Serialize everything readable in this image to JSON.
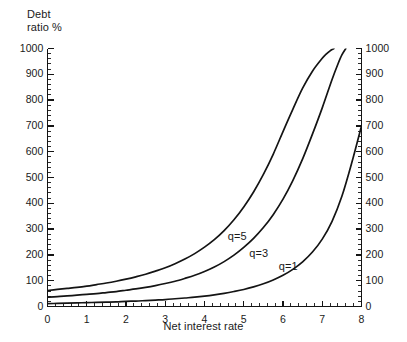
{
  "chart_data": {
    "type": "line",
    "title": "",
    "subtitle": "",
    "xlabel": "Net interest rate",
    "ylabel": "Debt ratio %",
    "ylabel_line1": "Debt",
    "ylabel_line2": "ratio %",
    "xlim": [
      0,
      8
    ],
    "ylim": [
      0,
      1000
    ],
    "grid": false,
    "legend_position": "inline-curve-labels",
    "dual_y_axis": true,
    "x_ticks": [
      0,
      1,
      2,
      3,
      4,
      5,
      6,
      7,
      8
    ],
    "x_tick_labels": [
      "0",
      "1",
      "2",
      "3",
      "4",
      "5",
      "6",
      "7",
      "8"
    ],
    "x_minor_tick_step": 0.2,
    "y_ticks": [
      0,
      100,
      200,
      300,
      400,
      500,
      600,
      700,
      800,
      900,
      1000
    ],
    "y_tick_labels": [
      "0",
      "100",
      "200",
      "300",
      "400",
      "500",
      "600",
      "700",
      "800",
      "900",
      "1000"
    ],
    "y_minor_tick_step": 20,
    "y_ticks_right": [
      0,
      100,
      200,
      300,
      400,
      500,
      600,
      700,
      800,
      900,
      1000
    ],
    "y_tick_labels_right": [
      "0",
      "100",
      "200",
      "300",
      "400",
      "500",
      "600",
      "700",
      "800",
      "900",
      "1000"
    ],
    "line_color": "#141414",
    "axis_color": "#141414",
    "background_color": "#ffffff",
    "series": [
      {
        "name": "q = 5",
        "label": "q=5",
        "label_x": 5.0,
        "label_y": 268,
        "x": [
          0.0,
          0.25,
          0.5,
          0.75,
          1.0,
          1.25,
          1.5,
          1.75,
          2.0,
          2.25,
          2.5,
          2.75,
          3.0,
          3.25,
          3.5,
          3.75,
          4.0,
          4.25,
          4.5,
          4.75,
          5.0,
          5.25,
          5.5,
          5.75,
          6.0,
          6.25,
          6.5,
          6.75,
          7.0,
          7.1,
          7.2,
          7.25,
          7.3
        ],
        "values": [
          62,
          66,
          70,
          74,
          79,
          85,
          91,
          98,
          106,
          115,
          125,
          137,
          150,
          166,
          184,
          205,
          230,
          259,
          294,
          336,
          386,
          444,
          512,
          590,
          678,
          764,
          846,
          912,
          962,
          978,
          991,
          996,
          1000
        ]
      },
      {
        "name": "q = 3",
        "label": "q=3",
        "label_x": 5.55,
        "label_y": 205,
        "x": [
          0.0,
          0.25,
          0.5,
          0.75,
          1.0,
          1.25,
          1.5,
          1.75,
          2.0,
          2.25,
          2.5,
          2.75,
          3.0,
          3.25,
          3.5,
          3.75,
          4.0,
          4.25,
          4.5,
          4.75,
          5.0,
          5.25,
          5.5,
          5.75,
          6.0,
          6.25,
          6.5,
          6.75,
          7.0,
          7.25,
          7.4,
          7.5,
          7.6
        ],
        "values": [
          36,
          38,
          41,
          44,
          47,
          50,
          54,
          58,
          63,
          68,
          74,
          81,
          89,
          98,
          109,
          121,
          136,
          153,
          174,
          199,
          229,
          264,
          306,
          356,
          416,
          488,
          572,
          668,
          770,
          880,
          940,
          975,
          1000
        ]
      },
      {
        "name": "q = 1",
        "label": "q=1",
        "label_x": 6.3,
        "label_y": 152,
        "x": [
          0.0,
          0.25,
          0.5,
          0.75,
          1.0,
          1.25,
          1.5,
          1.75,
          2.0,
          2.25,
          2.5,
          2.75,
          3.0,
          3.25,
          3.5,
          3.75,
          4.0,
          4.25,
          4.5,
          4.75,
          5.0,
          5.25,
          5.5,
          5.75,
          6.0,
          6.25,
          6.5,
          6.75,
          7.0,
          7.25,
          7.5,
          7.75,
          8.0
        ],
        "values": [
          11,
          12,
          13,
          14,
          15,
          16,
          17,
          18,
          20,
          21,
          23,
          25,
          27,
          30,
          33,
          36,
          40,
          45,
          51,
          58,
          66,
          76,
          88,
          103,
          121,
          144,
          173,
          211,
          261,
          330,
          427,
          556,
          700
        ]
      }
    ]
  }
}
